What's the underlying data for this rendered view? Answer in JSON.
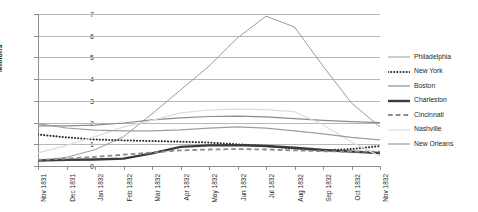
{
  "chart_data": {
    "type": "line",
    "title": "",
    "xlabel": "",
    "ylabel": "Millions",
    "ylim": [
      0,
      7
    ],
    "yticks": [
      0,
      1,
      2,
      3,
      4,
      5,
      6,
      7
    ],
    "grid": true,
    "legend_position": "right",
    "categories": [
      "Nov 1831",
      "Dec 1831",
      "Jan 1832",
      "Feb 1832",
      "Mar 1832",
      "Apr 1832",
      "May 1832",
      "Jun 1832",
      "Jul 1832",
      "Aug 1832",
      "Sep 1832",
      "Oct 1832",
      "Nov 1832"
    ],
    "series": [
      {
        "name": "Philadelphia",
        "style": "solid",
        "color": "#9a9a9a",
        "width": 1,
        "values": [
          0.25,
          0.4,
          0.75,
          1.35,
          2.4,
          3.5,
          4.6,
          5.9,
          6.9,
          6.4,
          4.6,
          2.9,
          1.8
        ]
      },
      {
        "name": "New York",
        "style": "dotted",
        "color": "#2b2b2b",
        "width": 2,
        "values": [
          1.45,
          1.32,
          1.22,
          1.18,
          1.15,
          1.12,
          1.08,
          1.0,
          0.92,
          0.8,
          0.72,
          0.78,
          0.92
        ]
      },
      {
        "name": "Boston",
        "style": "solid",
        "color": "#8c8c8c",
        "width": 1.2,
        "values": [
          1.85,
          1.85,
          1.88,
          1.98,
          2.12,
          2.22,
          2.28,
          2.3,
          2.26,
          2.18,
          2.1,
          2.04,
          2.0
        ]
      },
      {
        "name": "Charleston",
        "style": "solid",
        "color": "#3a3a3a",
        "width": 2.4,
        "values": [
          0.25,
          0.28,
          0.3,
          0.34,
          0.58,
          0.88,
          0.95,
          0.96,
          0.92,
          0.84,
          0.74,
          0.66,
          0.6
        ]
      },
      {
        "name": "Cincinnati",
        "style": "dashed",
        "color": "#8a8a8a",
        "width": 1.8,
        "values": [
          0.28,
          0.34,
          0.42,
          0.52,
          0.62,
          0.72,
          0.76,
          0.78,
          0.76,
          0.72,
          0.68,
          0.66,
          0.66
        ]
      },
      {
        "name": "Nashville",
        "style": "solid",
        "color": "#dcdcdc",
        "width": 1.2,
        "values": [
          0.6,
          0.95,
          1.35,
          1.8,
          2.1,
          2.45,
          2.58,
          2.62,
          2.6,
          2.5,
          1.9,
          1.1,
          0.45
        ]
      },
      {
        "name": "New Orleans",
        "style": "solid",
        "color": "#9e9e9e",
        "width": 1.2,
        "values": [
          1.95,
          1.75,
          1.65,
          1.62,
          1.62,
          1.66,
          1.74,
          1.8,
          1.74,
          1.62,
          1.48,
          1.32,
          1.2
        ]
      }
    ]
  }
}
